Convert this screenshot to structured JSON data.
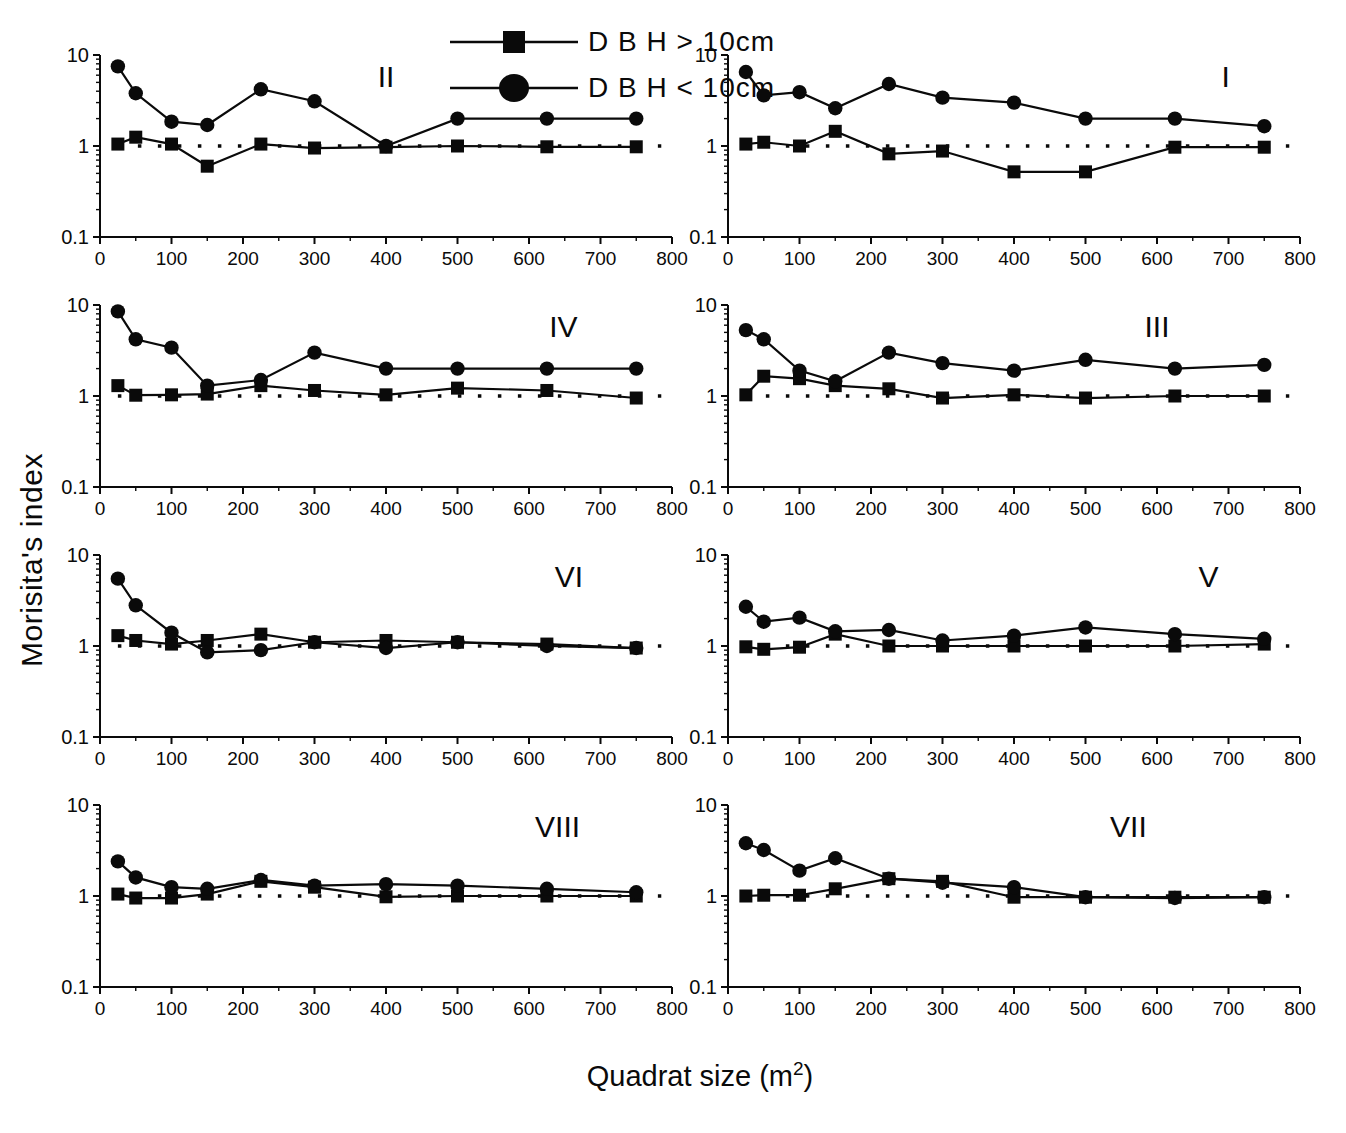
{
  "figure": {
    "ylabel": "Morisita's index",
    "xlabel": "Quadrat size (m²)"
  },
  "colors": {
    "ink": "#0a0a0a",
    "paper": "#ffffff"
  },
  "chart_data": {
    "type": "line",
    "x": [
      25,
      50,
      100,
      150,
      225,
      300,
      400,
      500,
      625,
      750
    ],
    "xlim": [
      0,
      800
    ],
    "x_major_step": 100,
    "x_minor_step": 50,
    "y_scale": "log",
    "ylim": [
      0.1,
      10
    ],
    "y_major_ticks": [
      0.1,
      1,
      10
    ],
    "reference_y": 1.0,
    "grid": false,
    "legend_position": "top-center",
    "series_defs": [
      {
        "key": "dbh_gt_10cm",
        "label": "D B H > 10cm",
        "marker": "square"
      },
      {
        "key": "dbh_lt_10cm",
        "label": "D B H < 10cm",
        "marker": "circle"
      }
    ],
    "panels": [
      {
        "label": "II",
        "label_frac": 0.5,
        "dbh_gt_10cm": [
          1.05,
          1.25,
          1.05,
          0.6,
          1.05,
          0.95,
          0.97,
          1.0,
          0.98,
          0.98
        ],
        "dbh_lt_10cm": [
          7.5,
          3.8,
          1.85,
          1.7,
          4.2,
          3.1,
          1.0,
          2.0,
          2.0,
          2.0
        ]
      },
      {
        "label": "I",
        "label_frac": 0.87,
        "dbh_gt_10cm": [
          1.05,
          1.1,
          1.0,
          1.45,
          0.82,
          0.88,
          0.52,
          0.52,
          0.97,
          0.97
        ],
        "dbh_lt_10cm": [
          6.5,
          3.6,
          3.9,
          2.6,
          4.8,
          3.4,
          3.0,
          2.0,
          2.0,
          1.65
        ]
      },
      {
        "label": "IV",
        "label_frac": 0.81,
        "dbh_gt_10cm": [
          1.3,
          1.02,
          1.03,
          1.05,
          1.3,
          1.15,
          1.03,
          1.22,
          1.15,
          0.95
        ],
        "dbh_lt_10cm": [
          8.5,
          4.2,
          3.4,
          1.3,
          1.5,
          3.0,
          2.0,
          2.0,
          2.0,
          2.0
        ]
      },
      {
        "label": "III",
        "label_frac": 0.75,
        "dbh_gt_10cm": [
          1.03,
          1.65,
          1.55,
          1.3,
          1.2,
          0.95,
          1.03,
          0.95,
          1.0,
          1.0
        ],
        "dbh_lt_10cm": [
          5.3,
          4.2,
          1.9,
          1.45,
          3.0,
          2.3,
          1.9,
          2.5,
          2.0,
          2.2
        ]
      },
      {
        "label": "VI",
        "label_frac": 0.82,
        "dbh_gt_10cm": [
          1.3,
          1.15,
          1.05,
          1.15,
          1.35,
          1.1,
          1.15,
          1.1,
          1.05,
          0.95
        ],
        "dbh_lt_10cm": [
          5.5,
          2.8,
          1.4,
          0.85,
          0.9,
          1.1,
          0.95,
          1.1,
          1.0,
          0.95
        ]
      },
      {
        "label": "V",
        "label_frac": 0.84,
        "dbh_gt_10cm": [
          0.98,
          0.92,
          0.97,
          1.35,
          1.0,
          1.0,
          1.0,
          1.0,
          1.0,
          1.05
        ],
        "dbh_lt_10cm": [
          2.7,
          1.85,
          2.05,
          1.45,
          1.5,
          1.15,
          1.3,
          1.6,
          1.35,
          1.2
        ]
      },
      {
        "label": "VIII",
        "label_frac": 0.8,
        "dbh_gt_10cm": [
          1.05,
          0.95,
          0.95,
          1.05,
          1.45,
          1.25,
          0.98,
          1.0,
          1.0,
          1.0
        ],
        "dbh_lt_10cm": [
          2.4,
          1.6,
          1.25,
          1.2,
          1.5,
          1.3,
          1.35,
          1.3,
          1.2,
          1.1
        ]
      },
      {
        "label": "VII",
        "label_frac": 0.7,
        "dbh_gt_10cm": [
          1.0,
          1.02,
          1.02,
          1.2,
          1.55,
          1.45,
          0.97,
          0.97,
          0.97,
          0.97
        ],
        "dbh_lt_10cm": [
          3.8,
          3.2,
          1.9,
          2.6,
          1.55,
          1.4,
          1.25,
          0.97,
          0.95,
          0.97
        ]
      }
    ]
  }
}
